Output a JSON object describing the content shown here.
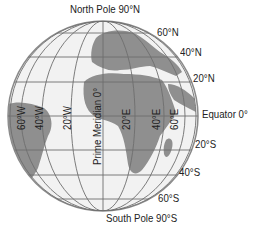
{
  "diagram": {
    "colors": {
      "ocean": "#f2f2f2",
      "land": "#8f8f8f",
      "grid": "#6e6e6e",
      "outline": "#8a8a8a",
      "text": "#222222"
    },
    "poles": {
      "north": "North Pole 90°N",
      "south": "South Pole 90°S"
    },
    "latitudes": {
      "n60": "60°N",
      "n40": "40°N",
      "n20": "20°N",
      "equator": "Equator 0°",
      "s20": "20°S",
      "s40": "40°S",
      "s60": "60°S"
    },
    "longitudes": {
      "w60": "60°W",
      "w40": "40°W",
      "w20": "20°W",
      "prime": "Prime Meridian 0°",
      "e20": "20°E",
      "e40": "40°E",
      "e60": "60°E"
    }
  }
}
